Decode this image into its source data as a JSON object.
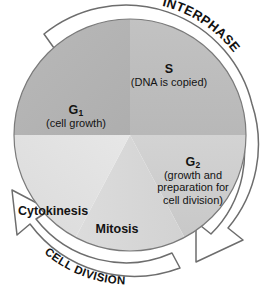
{
  "diagram": {
    "type": "cycle-pie",
    "center": {
      "x": 130,
      "y": 135
    },
    "radius": 116
  },
  "band_labels": [
    {
      "id": "interphase",
      "text": "INTERPHASE",
      "position": "top-right-arc"
    },
    {
      "id": "cell-division",
      "text": "CELL DIVISION",
      "position": "bottom-left-arc"
    }
  ],
  "arrows": [
    {
      "id": "interphase-arrow",
      "direction": "counterclockwise",
      "head": "bottom-right"
    },
    {
      "id": "cell-division-arrow",
      "direction": "counterclockwise",
      "head": "left"
    }
  ],
  "phases": [
    {
      "id": "g1",
      "name": "G",
      "subscript": "1",
      "description": "(cell growth)",
      "color": "#b4b4b4",
      "start_deg": 180,
      "end_deg": 270
    },
    {
      "id": "s",
      "name": "S",
      "subscript": "",
      "description": "(DNA is copied)",
      "color": "#bdbdbd",
      "start_deg": 270,
      "end_deg": 360
    },
    {
      "id": "g2",
      "name": "G",
      "subscript": "2",
      "description_lines": [
        "(growth and",
        "preparation for",
        "cell division)"
      ],
      "color": "#cfcfcf",
      "start_deg": 0,
      "end_deg": 62
    },
    {
      "id": "mitosis",
      "name": "Mitosis",
      "subscript": "",
      "description": "",
      "color": "#d8d8d8",
      "start_deg": 62,
      "end_deg": 118
    },
    {
      "id": "cytokinesis",
      "name": "Cytokinesis",
      "subscript": "",
      "description": "",
      "color": "#e4e4e4",
      "start_deg": 118,
      "end_deg": 180
    }
  ],
  "labels": {
    "g1_head": "G",
    "g1_sub": "1",
    "g1_desc": "(cell growth)",
    "s_head": "S",
    "s_desc": "(DNA is copied)",
    "g2_head": "G",
    "g2_sub": "2",
    "g2_desc_1": "(growth and",
    "g2_desc_2": "preparation for",
    "g2_desc_3": "cell division)",
    "cytokinesis": "Cytokinesis",
    "mitosis": "Mitosis",
    "interphase": "INTERPHASE",
    "cell_division": "CELL DIVISION"
  },
  "colors": {
    "background": "#ffffff",
    "outline": "#6d6d6d",
    "band_fill": "#ffffff",
    "text": "#131313"
  }
}
